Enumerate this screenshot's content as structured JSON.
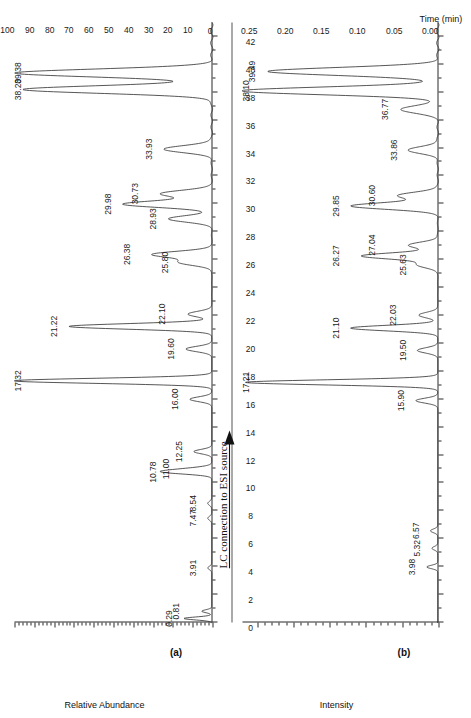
{
  "figure": {
    "annotation": {
      "text": "LC connection to ESI source",
      "arrow": "arrow-right"
    },
    "x_axis": {
      "title": "Time (min)",
      "ticks": [
        0,
        2,
        4,
        6,
        8,
        10,
        12,
        14,
        16,
        18,
        20,
        22,
        24,
        26,
        28,
        30,
        32,
        34,
        36,
        38,
        40,
        42
      ],
      "min": 0,
      "max": 43
    }
  },
  "panel_a": {
    "letter": "(a)",
    "y_title": "Relative Abundance",
    "y_ticks": [
      0,
      10,
      20,
      30,
      40,
      50,
      60,
      70,
      80,
      90,
      100
    ],
    "peak_labels": [
      "0.29",
      "0.81",
      "3.91",
      "7.47",
      "8.54",
      "10.78",
      "11.00",
      "12.25",
      "16.00",
      "17.32",
      "19.60",
      "21.22",
      "22.10",
      "25.80",
      "26.38",
      "28.93",
      "29.98",
      "30.73",
      "33.93",
      "38.20",
      "39.38"
    ]
  },
  "panel_b": {
    "letter": "(b)",
    "y_title": "Intensity",
    "y_ticks": [
      "0.00",
      "0.05",
      "0.10",
      "0.15",
      "0.20",
      "0.25"
    ],
    "peak_labels": [
      "3.98",
      "5.32",
      "6.57",
      "15.90",
      "17.21",
      "19.50",
      "21.10",
      "22.03",
      "25.63",
      "26.27",
      "27.04",
      "29.85",
      "30.60",
      "33.86",
      "36.77",
      "38.10",
      "39.49"
    ]
  },
  "chart_data": {
    "type": "line",
    "title": "",
    "xlabel": "Time (min)",
    "xlim": [
      0,
      43
    ],
    "grid": false,
    "legend": "none",
    "charts": [
      {
        "panel": "(a)",
        "ylabel": "Relative Abundance",
        "ylim": [
          0,
          100
        ],
        "yticks": [
          0,
          10,
          20,
          30,
          40,
          50,
          60,
          70,
          80,
          90,
          100
        ],
        "peaks": [
          {
            "rt": 0.29,
            "height": 14
          },
          {
            "rt": 0.81,
            "height": 5
          },
          {
            "rt": 3.91,
            "height": 2
          },
          {
            "rt": 7.47,
            "height": 2
          },
          {
            "rt": 8.54,
            "height": 2
          },
          {
            "rt": 10.78,
            "height": 22
          },
          {
            "rt": 11.0,
            "height": 10
          },
          {
            "rt": 12.25,
            "height": 9
          },
          {
            "rt": 16.0,
            "height": 11
          },
          {
            "rt": 17.32,
            "height": 100
          },
          {
            "rt": 19.6,
            "height": 13
          },
          {
            "rt": 21.22,
            "height": 72
          },
          {
            "rt": 22.1,
            "height": 12
          },
          {
            "rt": 25.8,
            "height": 16
          },
          {
            "rt": 26.38,
            "height": 30
          },
          {
            "rt": 28.93,
            "height": 22
          },
          {
            "rt": 29.98,
            "height": 45
          },
          {
            "rt": 30.73,
            "height": 26
          },
          {
            "rt": 33.93,
            "height": 24
          },
          {
            "rt": 38.2,
            "height": 95
          },
          {
            "rt": 39.38,
            "height": 100
          }
        ]
      },
      {
        "panel": "(b)",
        "ylabel": "Intensity",
        "ylim": [
          0.0,
          0.27
        ],
        "yticks": [
          0.0,
          0.05,
          0.1,
          0.15,
          0.2,
          0.25
        ],
        "peaks": [
          {
            "rt": 3.98,
            "height": 0.015
          },
          {
            "rt": 5.32,
            "height": 0.008
          },
          {
            "rt": 6.57,
            "height": 0.01
          },
          {
            "rt": 15.9,
            "height": 0.03
          },
          {
            "rt": 17.21,
            "height": 0.265
          },
          {
            "rt": 19.5,
            "height": 0.028
          },
          {
            "rt": 21.1,
            "height": 0.12
          },
          {
            "rt": 22.03,
            "height": 0.026
          },
          {
            "rt": 25.63,
            "height": 0.028
          },
          {
            "rt": 26.27,
            "height": 0.105
          },
          {
            "rt": 27.04,
            "height": 0.04
          },
          {
            "rt": 29.85,
            "height": 0.12
          },
          {
            "rt": 30.6,
            "height": 0.055
          },
          {
            "rt": 33.86,
            "height": 0.04
          },
          {
            "rt": 36.77,
            "height": 0.052
          },
          {
            "rt": 38.1,
            "height": 0.27
          },
          {
            "rt": 39.49,
            "height": 0.235
          }
        ]
      }
    ]
  }
}
